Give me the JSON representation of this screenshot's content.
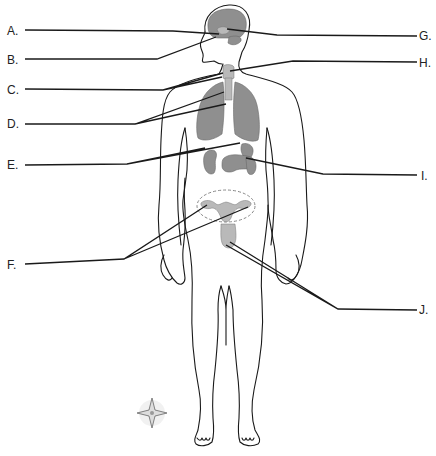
{
  "diagram": {
    "labels": {
      "left": [
        {
          "id": "A",
          "text": "A."
        },
        {
          "id": "B",
          "text": "B."
        },
        {
          "id": "C",
          "text": "C."
        },
        {
          "id": "D",
          "text": "D."
        },
        {
          "id": "E",
          "text": "E."
        },
        {
          "id": "F",
          "text": "F."
        }
      ],
      "right": [
        {
          "id": "G",
          "text": "G."
        },
        {
          "id": "H",
          "text": "H."
        },
        {
          "id": "I",
          "text": "I."
        },
        {
          "id": "J",
          "text": "J."
        }
      ]
    },
    "colors": {
      "organ_fill": "#8f8f8f",
      "outline": "#1a1a1a",
      "background": "#ffffff"
    }
  }
}
